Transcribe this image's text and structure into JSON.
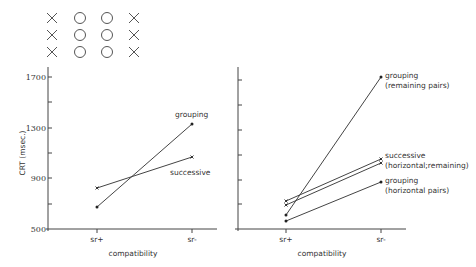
{
  "stimulus": {
    "rows": [
      [
        "x",
        "o",
        "o",
        "x"
      ],
      [
        "x",
        "o",
        "o",
        "x"
      ],
      [
        "x",
        "o",
        "o",
        "x"
      ]
    ],
    "glyphs": {
      "x": "×",
      "o": "○"
    }
  },
  "labels": {
    "ylabel": "CRT (msec.)",
    "xlabel_left": "compatibility",
    "xlabel_right": "compatibility",
    "yticks": [
      "1700",
      "1300",
      "900",
      "500"
    ],
    "xticks_left": [
      "sr+",
      "sr-"
    ],
    "xticks_right": [
      "sr+",
      "sr-"
    ],
    "left_grouping": "grouping",
    "left_successive": "successive",
    "right_grouping_remaining_1": "grouping",
    "right_grouping_remaining_2": "(remaining pairs)",
    "right_successive_1": "successive",
    "right_successive_2": "(horizontal;remaining)",
    "right_grouping_horizontal_1": "grouping",
    "right_grouping_horizontal_2": "(horizontal pairs)"
  },
  "chart_data": [
    {
      "type": "line",
      "title": "",
      "xlabel": "compatibility",
      "ylabel": "CRT (msec.)",
      "categories": [
        "sr+",
        "sr-"
      ],
      "ylim": [
        500,
        1800
      ],
      "yticks": [
        500,
        700,
        900,
        1100,
        1300,
        1500,
        1700
      ],
      "ytick_labels": [
        "500",
        "",
        "900",
        "",
        "1300",
        "",
        "1700"
      ],
      "grid": false,
      "legend": "inline labels",
      "series": [
        {
          "name": "grouping",
          "marker": "dot",
          "values": [
            675,
            1330
          ]
        },
        {
          "name": "successive",
          "marker": "x",
          "values": [
            825,
            1070
          ]
        }
      ]
    },
    {
      "type": "line",
      "title": "",
      "xlabel": "compatibility",
      "ylabel": "CRT (msec.)",
      "categories": [
        "sr+",
        "sr-"
      ],
      "ylim": [
        500,
        1800
      ],
      "yticks": [
        500,
        700,
        900,
        1100,
        1300,
        1500,
        1700
      ],
      "ytick_labels": [],
      "grid": false,
      "legend": "inline labels",
      "series": [
        {
          "name": "grouping (remaining pairs)",
          "marker": "dot",
          "values": [
            610,
            1700
          ]
        },
        {
          "name": "successive (horizontal)",
          "marker": "x",
          "values": [
            720,
            1050
          ]
        },
        {
          "name": "successive (remaining)",
          "marker": "x",
          "values": [
            690,
            1020
          ]
        },
        {
          "name": "grouping (horizontal pairs)",
          "marker": "dot",
          "values": [
            565,
            870
          ]
        }
      ]
    }
  ]
}
